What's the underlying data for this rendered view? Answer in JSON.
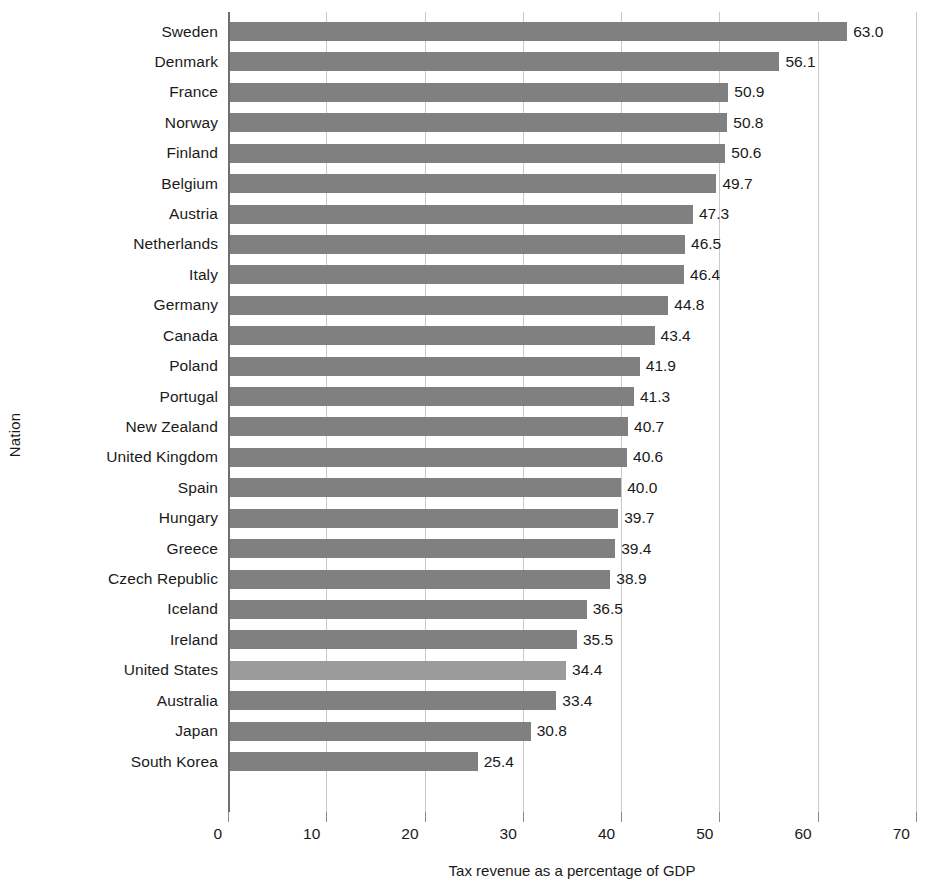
{
  "chart_data": {
    "type": "bar",
    "orientation": "horizontal",
    "title": "",
    "xlabel": "Tax revenue as a percentage of GDP",
    "ylabel": "Nation",
    "xlim": [
      0,
      70
    ],
    "xticks": [
      0,
      10,
      20,
      30,
      40,
      50,
      60,
      70
    ],
    "xtick_labels": [
      "0",
      "10",
      "20",
      "30",
      "40",
      "50",
      "60",
      "70"
    ],
    "grid": true,
    "grid_axis": "x",
    "legend": "none",
    "bar_color": "#808080",
    "highlight_color": "#9b9b9b",
    "highlight_category": "United States",
    "categories": [
      "Sweden",
      "Denmark",
      "France",
      "Norway",
      "Finland",
      "Belgium",
      "Austria",
      "Netherlands",
      "Italy",
      "Germany",
      "Canada",
      "Poland",
      "Portugal",
      "New Zealand",
      "United Kingdom",
      "Spain",
      "Hungary",
      "Greece",
      "Czech Republic",
      "Iceland",
      "Ireland",
      "United States",
      "Australia",
      "Japan",
      "South Korea"
    ],
    "values": [
      63.0,
      56.1,
      50.9,
      50.8,
      50.6,
      49.7,
      47.3,
      46.5,
      46.4,
      44.8,
      43.4,
      41.9,
      41.3,
      40.7,
      40.6,
      40.0,
      39.7,
      39.4,
      38.9,
      36.5,
      35.5,
      34.4,
      33.4,
      30.8,
      25.4
    ],
    "value_labels": [
      "63.0",
      "56.1",
      "50.9",
      "50.8",
      "50.6",
      "49.7",
      "47.3",
      "46.5",
      "46.4",
      "44.8",
      "43.4",
      "41.9",
      "41.3",
      "40.7",
      "40.6",
      "40.0",
      "39.7",
      "39.4",
      "38.9",
      "36.5",
      "35.5",
      "34.4",
      "33.4",
      "30.8",
      "25.4"
    ]
  }
}
